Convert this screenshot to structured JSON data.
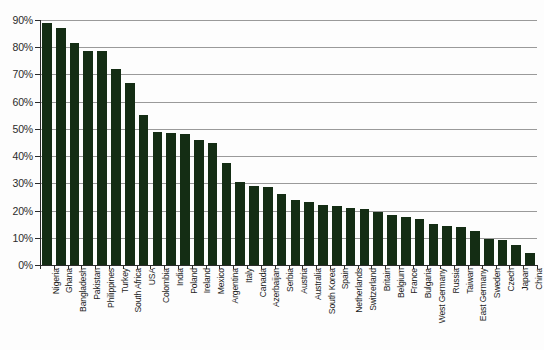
{
  "chart_data": {
    "type": "bar",
    "title": "",
    "subtitle": "",
    "xlabel": "",
    "ylabel": "",
    "ylim": [
      0,
      90
    ],
    "ytick_labels": [
      "0%",
      "10%",
      "20%",
      "30%",
      "40%",
      "50%",
      "60%",
      "70%",
      "80%",
      "90%"
    ],
    "ytick_values": [
      0,
      10,
      20,
      30,
      40,
      50,
      60,
      70,
      80,
      90
    ],
    "grid": true,
    "legend": false,
    "bar_color": "#142d14",
    "axis_color": "#2b2b2b",
    "gridline_color": "#9a9a9a",
    "background_color": "#fdfdfd",
    "categories": [
      "Nigeria",
      "Ghana",
      "Bangladesh",
      "Pakistan",
      "Philippines",
      "Turkey",
      "South Africa",
      "USA",
      "Colombia",
      "India",
      "Poland",
      "Ireland",
      "Mexico",
      "Argentina",
      "Italy",
      "Canada",
      "Azerbaijan",
      "Serbia",
      "Austria",
      "Australia",
      "South Korea",
      "Spain",
      "Netherlands",
      "Switzerland",
      "Britain",
      "Belgium",
      "France",
      "Bulgaria",
      "West Germany",
      "Russia",
      "Taiwan",
      "East Germany",
      "Sweden",
      "Czech",
      "Japan",
      "China"
    ],
    "values": [
      89.0,
      87.0,
      81.5,
      78.5,
      78.5,
      72.0,
      67.0,
      55.0,
      49.0,
      48.5,
      48.0,
      46.0,
      45.0,
      37.5,
      30.5,
      29.0,
      28.5,
      26.0,
      24.0,
      23.0,
      22.0,
      21.5,
      21.0,
      20.5,
      19.5,
      18.5,
      17.5,
      17.0,
      15.0,
      14.5,
      14.0,
      12.5,
      9.6,
      9.3,
      7.4,
      4.4
    ]
  }
}
